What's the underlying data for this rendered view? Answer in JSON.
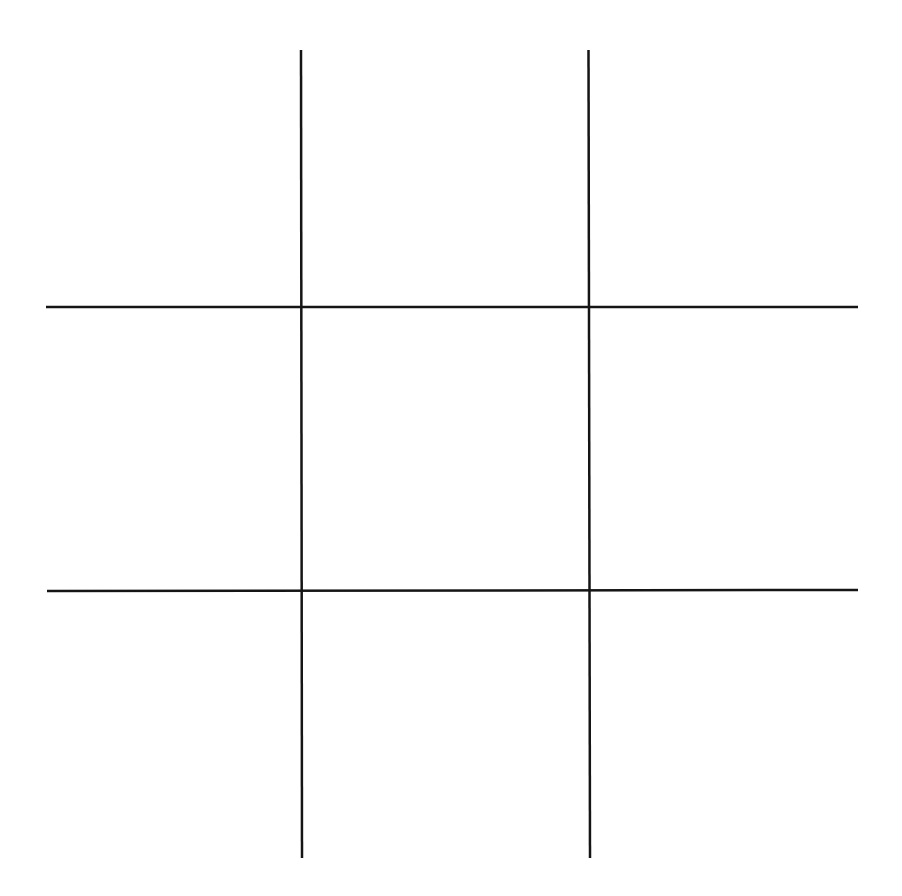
{
  "game": {
    "name": "tic-tac-toe",
    "board_size": 3,
    "line_color": "#151515",
    "background_color": "#ffffff",
    "cells": [
      {
        "row": 0,
        "col": 0,
        "mark": ""
      },
      {
        "row": 0,
        "col": 1,
        "mark": ""
      },
      {
        "row": 0,
        "col": 2,
        "mark": ""
      },
      {
        "row": 1,
        "col": 0,
        "mark": ""
      },
      {
        "row": 1,
        "col": 1,
        "mark": ""
      },
      {
        "row": 1,
        "col": 2,
        "mark": ""
      },
      {
        "row": 2,
        "col": 0,
        "mark": ""
      },
      {
        "row": 2,
        "col": 1,
        "mark": ""
      },
      {
        "row": 2,
        "col": 2,
        "mark": ""
      }
    ]
  }
}
